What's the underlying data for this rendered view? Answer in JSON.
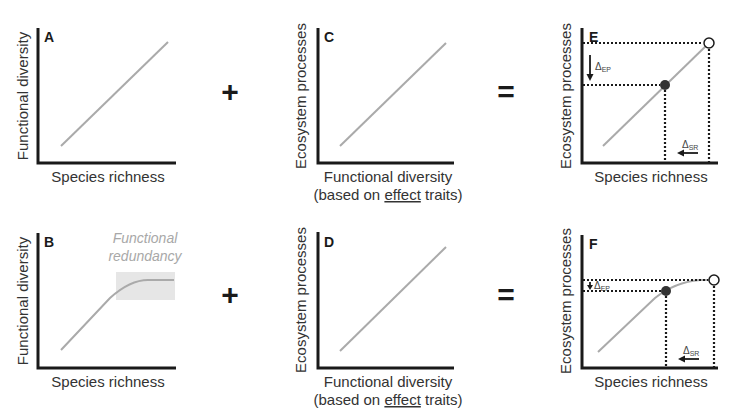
{
  "figure": {
    "operators": {
      "plus": "+",
      "equals": "="
    },
    "panels": {
      "A": {
        "letter": "A",
        "ylabel": "Functional diversity",
        "xlabel": "Species richness",
        "relation": "linear"
      },
      "B": {
        "letter": "B",
        "ylabel": "Functional diversity",
        "xlabel": "Species richness",
        "relation": "saturating",
        "annotation_line1": "Functional",
        "annotation_line2": "redundancy"
      },
      "C": {
        "letter": "C",
        "ylabel": "Ecosystem processes",
        "xlabel_line1": "Functional diversity",
        "xlabel_pre": "(based on ",
        "xlabel_underlined": "effect",
        "xlabel_post": " traits)",
        "relation": "linear"
      },
      "D": {
        "letter": "D",
        "ylabel": "Ecosystem processes",
        "xlabel_line1": "Functional diversity",
        "xlabel_pre": "(based on ",
        "xlabel_underlined": "effect",
        "xlabel_post": " traits)",
        "relation": "linear"
      },
      "E": {
        "letter": "E",
        "ylabel": "Ecosystem processes",
        "xlabel": "Species richness",
        "relation": "linear",
        "delta_ep": "Δ",
        "delta_ep_sub": "EP",
        "delta_sr": "Δ",
        "delta_sr_sub": "SR"
      },
      "F": {
        "letter": "F",
        "ylabel": "Ecosystem processes",
        "xlabel": "Species richness",
        "relation": "saturating",
        "delta_ep": "Δ",
        "delta_ep_sub": "EP",
        "delta_sr": "Δ",
        "delta_sr_sub": "SR"
      }
    },
    "colors": {
      "axis": "#1a1a1a",
      "curve": "#aaaaaa",
      "redundancy_box": "#e6e6e6",
      "annotation": "#a8a8a8"
    }
  }
}
